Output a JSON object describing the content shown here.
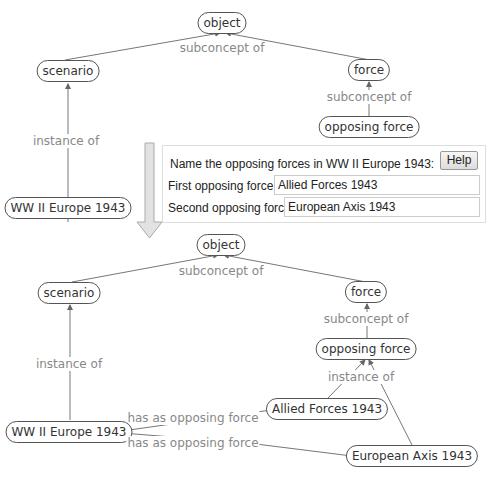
{
  "top_diagram": {
    "nodes": {
      "object": "object",
      "scenario": "scenario",
      "force": "force",
      "opposing_force": "opposing force",
      "ww2": "WW II Europe 1943"
    },
    "labels": {
      "subconcept_top": "subconcept of",
      "subconcept_force": "subconcept of",
      "instance_of": "instance of"
    }
  },
  "panel": {
    "question": "Name the opposing forces in WW II Europe 1943:",
    "help_label": "Help",
    "first_label": "First opposing force:",
    "first_value": "Allied Forces 1943",
    "second_label": "Second opposing force",
    "second_value": "European Axis 1943"
  },
  "bottom_diagram": {
    "nodes": {
      "object": "object",
      "scenario": "scenario",
      "force": "force",
      "opposing_force": "opposing force",
      "ww2": "WW II Europe 1943",
      "allied": "Allied Forces 1943",
      "axis": "European Axis 1943"
    },
    "labels": {
      "subconcept_top": "subconcept of",
      "subconcept_force": "subconcept of",
      "instance_of_left": "instance of",
      "instance_of_right": "instance of",
      "has_opposing_1": "has as opposing force",
      "has_opposing_2": "has as opposing force"
    }
  }
}
